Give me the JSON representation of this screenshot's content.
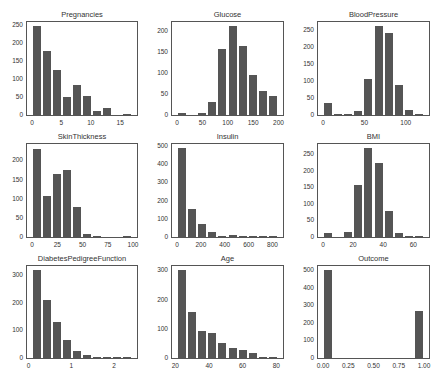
{
  "chart_data": [
    {
      "type": "bar",
      "title": "Pregnancies",
      "xlim": [
        -0.85,
        17.85
      ],
      "ylim": [
        0,
        258
      ],
      "bin_edges": [
        0,
        1.7,
        3.4,
        5.1,
        6.8,
        8.5,
        10.2,
        11.9,
        13.6,
        15.3,
        17
      ],
      "values": [
        246,
        178,
        125,
        50,
        83,
        52,
        11,
        19,
        0,
        2
      ],
      "xticks": [
        0,
        5,
        10,
        15
      ],
      "yticks": [
        0,
        50,
        100,
        150,
        200,
        250
      ]
    },
    {
      "type": "bar",
      "title": "Glucose",
      "xlim": [
        -9.95,
        208.95
      ],
      "ylim": [
        0,
        221
      ],
      "bin_edges": [
        0,
        19.9,
        39.8,
        59.7,
        79.6,
        99.5,
        119.4,
        139.3,
        159.2,
        179.1,
        199
      ],
      "values": [
        5,
        0,
        4,
        32,
        156,
        211,
        163,
        95,
        56,
        46
      ],
      "xticks": [
        0,
        50,
        100,
        150,
        200
      ],
      "yticks": [
        0,
        50,
        100,
        150,
        200
      ]
    },
    {
      "type": "bar",
      "title": "BloodPressure",
      "xlim": [
        -6.1,
        128.1
      ],
      "ylim": [
        0,
        274
      ],
      "bin_edges": [
        0,
        12.2,
        24.4,
        36.6,
        48.8,
        61,
        73.2,
        85.4,
        97.6,
        109.8,
        122
      ],
      "values": [
        35,
        1,
        2,
        13,
        107,
        261,
        243,
        87,
        14,
        3
      ],
      "xticks": [
        0,
        50,
        100
      ],
      "yticks": [
        0,
        50,
        100,
        150,
        200,
        250
      ]
    },
    {
      "type": "bar",
      "title": "SkinThickness",
      "xlim": [
        -4.95,
        103.95
      ],
      "ylim": [
        0,
        243
      ],
      "bin_edges": [
        0,
        9.9,
        19.8,
        29.7,
        39.6,
        49.5,
        59.4,
        69.3,
        79.2,
        89.1,
        99
      ],
      "values": [
        231,
        107,
        165,
        175,
        78,
        9,
        2,
        0,
        0,
        1
      ],
      "xticks": [
        0,
        25,
        50,
        75,
        100
      ],
      "yticks": [
        0,
        50,
        100,
        150,
        200
      ]
    },
    {
      "type": "bar",
      "title": "Insulin",
      "xlim": [
        -42.3,
        888.3
      ],
      "ylim": [
        0,
        511
      ],
      "bin_edges": [
        0,
        84.6,
        169.2,
        253.8,
        338.4,
        423,
        507.6,
        592.2,
        676.8,
        761.4,
        846
      ],
      "values": [
        487,
        155,
        70,
        30,
        8,
        9,
        5,
        1,
        2,
        1
      ],
      "xticks": [
        0,
        200,
        400,
        600,
        800
      ],
      "yticks": [
        0,
        100,
        200,
        300,
        400,
        500
      ]
    },
    {
      "type": "bar",
      "title": "BMI",
      "xlim": [
        -3.355,
        70.455
      ],
      "ylim": [
        0,
        281
      ],
      "bin_edges": [
        0,
        6.71,
        13.42,
        20.13,
        26.84,
        33.55,
        40.26,
        46.97,
        53.68,
        60.39,
        67.1
      ],
      "values": [
        11,
        0,
        15,
        156,
        268,
        224,
        78,
        12,
        3,
        1
      ],
      "xticks": [
        0,
        20,
        40,
        60
      ],
      "yticks": [
        0,
        50,
        100,
        150,
        200,
        250
      ]
    },
    {
      "type": "bar",
      "title": "DiabetesPedigreeFunction",
      "xlim": [
        -0.039,
        2.537
      ],
      "ylim": [
        0,
        334
      ],
      "bin_edges": [
        0.078,
        0.3122,
        0.5464,
        0.7806,
        1.0148,
        1.249,
        1.4832,
        1.7174,
        1.9516,
        2.1858,
        2.42
      ],
      "values": [
        318,
        209,
        129,
        66,
        26,
        12,
        3,
        1,
        2,
        2
      ],
      "xticks": [
        0,
        1,
        2
      ],
      "yticks": [
        0,
        100,
        200,
        300
      ]
    },
    {
      "type": "bar",
      "title": "Age",
      "xlim": [
        18,
        84
      ],
      "ylim": [
        0,
        315
      ],
      "bin_edges": [
        21,
        27,
        33,
        39,
        45,
        51,
        57,
        63,
        69,
        75,
        81
      ],
      "values": [
        300,
        157,
        92,
        86,
        52,
        34,
        26,
        16,
        4,
        1
      ],
      "xticks": [
        20,
        40,
        60,
        80
      ],
      "yticks": [
        0,
        100,
        200,
        300
      ]
    },
    {
      "type": "bar",
      "title": "Outcome",
      "xlim": [
        -0.05,
        1.05
      ],
      "ylim": [
        0,
        525
      ],
      "bin_edges": [
        0,
        0.1,
        0.2,
        0.3,
        0.4,
        0.5,
        0.6,
        0.7,
        0.8,
        0.9,
        1.0
      ],
      "values": [
        500,
        0,
        0,
        0,
        0,
        0,
        0,
        0,
        0,
        268
      ],
      "xticks": [
        0.0,
        0.25,
        0.5,
        0.75,
        1.0
      ],
      "xtick_labels": [
        "0.00",
        "0.25",
        "0.50",
        "0.75",
        "1.00"
      ],
      "yticks": [
        0,
        100,
        200,
        300,
        400,
        500
      ]
    }
  ],
  "layout": {
    "cols": [
      {
        "left": 26,
        "right": 138
      },
      {
        "left": 171,
        "right": 284
      },
      {
        "left": 317,
        "right": 430
      }
    ],
    "rows": [
      {
        "top": 21,
        "bottom": 116
      },
      {
        "top": 143,
        "bottom": 238
      },
      {
        "top": 265,
        "bottom": 359
      }
    ],
    "bar_color": "#555555",
    "frame_color": "#555555"
  }
}
